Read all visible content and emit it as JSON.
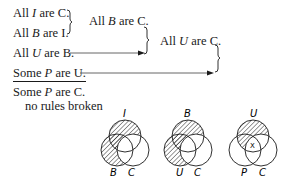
{
  "premises": [
    {
      "pre": "All ",
      "var": "I",
      "post": " are C."
    },
    {
      "pre": "All ",
      "var": "B",
      "post": " are I."
    },
    {
      "pre": "All ",
      "var": "U",
      "post": " are B."
    },
    {
      "pre": "Some ",
      "var": "P",
      "post": " are U."
    }
  ],
  "intermediate": [
    {
      "pre": "All ",
      "var": "B",
      "post": " are C."
    },
    {
      "pre": "All ",
      "var": "U",
      "post": " are C."
    }
  ],
  "conclusion": {
    "pre": "Some ",
    "var": "P",
    "post": " are C."
  },
  "verdict": "no rules broken",
  "venn_diagrams": [
    {
      "top": "I",
      "left": "B",
      "right": "C",
      "shaded": [
        "top-outside-right",
        "left-outside-right"
      ],
      "x_mark": false
    },
    {
      "top": "B",
      "left": "U",
      "right": "C",
      "shaded": [
        "top-outside-right",
        "left-outside-right"
      ],
      "x_mark": false
    },
    {
      "top": "U",
      "left": "P",
      "right": "C",
      "shaded": [
        "top-outside-right"
      ],
      "x_mark": true,
      "x_label": "X"
    }
  ]
}
